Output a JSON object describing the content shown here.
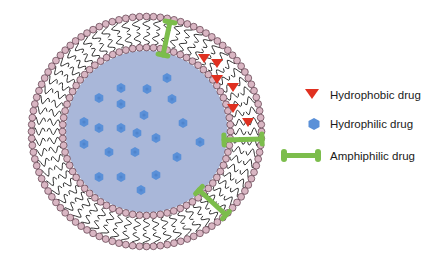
{
  "figure": {
    "type": "liposome-drug-loading-diagram",
    "vesicle": {
      "center": [
        146.5,
        131.5
      ],
      "outer_radius": 117,
      "inner_radius": 84,
      "core_radius": 81,
      "head_radius": 3.4,
      "outer_head_count": 104,
      "inner_head_count": 76
    },
    "colors": {
      "background": "#ffffff",
      "core": "#a9b7d9",
      "head_fill": "#d9b6c3",
      "head_stroke": "#5a3a48",
      "tail": "#1e1e1e",
      "hydrophobic": "#e03020",
      "hydrophilic": "#5a90d8",
      "hydrophilic_center": "#4a7fc8",
      "amphiphilic": "#7cbd4c"
    },
    "hydrophilic_drugs": [
      [
        167,
        78
      ],
      [
        121,
        88
      ],
      [
        147,
        89
      ],
      [
        99,
        98
      ],
      [
        121,
        104
      ],
      [
        172,
        99
      ],
      [
        144,
        115
      ],
      [
        84,
        122
      ],
      [
        99,
        128
      ],
      [
        121,
        128
      ],
      [
        183,
        123
      ],
      [
        137,
        133
      ],
      [
        156,
        138
      ],
      [
        200,
        142
      ],
      [
        84,
        144
      ],
      [
        109,
        152
      ],
      [
        135,
        152
      ],
      [
        177,
        157
      ],
      [
        99,
        177
      ],
      [
        121,
        177
      ],
      [
        156,
        175
      ],
      [
        141,
        190
      ]
    ],
    "hydrophobic_drugs": [
      [
        204,
        58
      ],
      [
        217,
        63
      ],
      [
        217,
        79
      ],
      [
        233,
        87
      ],
      [
        233,
        108
      ],
      [
        248,
        122
      ]
    ],
    "amphiphilic_drugs": [
      {
        "from": [
          170,
          22
        ],
        "to": [
          163,
          55
        ]
      },
      {
        "from": [
          224,
          140
        ],
        "to": [
          262,
          139
        ]
      },
      {
        "from": [
          199,
          190
        ],
        "to": [
          226,
          215
        ]
      }
    ]
  },
  "legend": {
    "items": [
      {
        "label": "Hydrophobic drug",
        "symbol": "red-triangle"
      },
      {
        "label": "Hydrophilic drug",
        "symbol": "blue-hexagon"
      },
      {
        "label": "Amphiphilic drug",
        "symbol": "green-bar"
      }
    ]
  }
}
